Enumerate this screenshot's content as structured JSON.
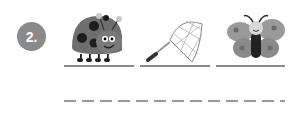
{
  "exercise": {
    "number_label": "2.",
    "items": [
      {
        "name": "ladybug",
        "icon": "ladybug-icon"
      },
      {
        "name": "butterfly net",
        "icon": "net-icon"
      },
      {
        "name": "butterfly",
        "icon": "butterfly-icon"
      }
    ],
    "answer_line": "dashed"
  },
  "colors": {
    "badge": "#8a8a8a",
    "lines": "#8c8c8c"
  }
}
